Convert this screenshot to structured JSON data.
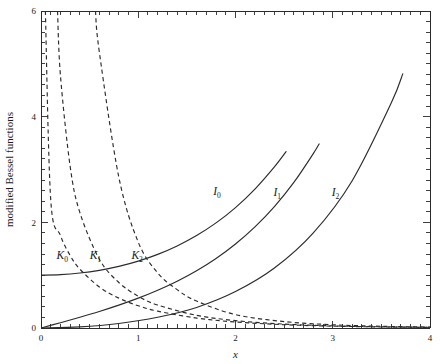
{
  "chart_data": {
    "type": "line",
    "title": "",
    "xlabel": "x",
    "ylabel": "modified Bessel functions",
    "xlim": [
      0,
      4
    ],
    "ylim": [
      0,
      6
    ],
    "xticks": [
      0,
      1,
      2,
      3,
      4
    ],
    "xtick_labels": [
      "0",
      "1",
      "2",
      "3",
      "4"
    ],
    "yticks": [
      0,
      2,
      4,
      6
    ],
    "ytick_labels": [
      "0",
      "2",
      "4",
      "6"
    ],
    "xminor_step": 0.1,
    "yminor_step": 0.2,
    "grid": false,
    "legend": "inline-labels",
    "series": [
      {
        "name": "I_0",
        "label": "I",
        "subscript": "0",
        "style": "solid",
        "color": "#2b2b2b",
        "label_x": 1.77,
        "label_y": 2.52,
        "x": [
          0,
          0.2,
          0.4,
          0.6,
          0.8,
          1.0,
          1.2,
          1.4,
          1.6,
          1.8,
          2.0,
          2.2,
          2.4,
          2.52
        ],
        "y": [
          1.0,
          1.01,
          1.0404,
          1.092,
          1.1665,
          1.2661,
          1.3937,
          1.5534,
          1.75,
          1.9896,
          2.2796,
          2.6291,
          3.0493,
          3.3387
        ]
      },
      {
        "name": "I_1",
        "label": "I",
        "subscript": "1",
        "style": "solid",
        "color": "#2b2b2b",
        "label_x": 2.39,
        "label_y": 2.5,
        "x": [
          0,
          0.2,
          0.4,
          0.6,
          0.8,
          1.0,
          1.2,
          1.4,
          1.6,
          1.8,
          2.0,
          2.2,
          2.4,
          2.6,
          2.8,
          2.86
        ],
        "y": [
          0.0,
          0.1005,
          0.204,
          0.3137,
          0.4329,
          0.5652,
          0.7147,
          0.8861,
          1.0848,
          1.3172,
          1.5906,
          1.9141,
          2.2981,
          2.7554,
          3.3011,
          3.4833
        ]
      },
      {
        "name": "I_2",
        "label": "I",
        "subscript": "2",
        "style": "solid",
        "color": "#2b2b2b",
        "label_x": 2.99,
        "label_y": 2.5,
        "x": [
          0,
          0.4,
          0.8,
          1.2,
          1.6,
          2.0,
          2.4,
          2.8,
          3.2,
          3.6,
          3.72
        ],
        "y": [
          0.0,
          0.0203,
          0.0843,
          0.2026,
          0.3885,
          0.6889,
          1.1342,
          1.7994,
          2.7883,
          4.2536,
          4.81
        ]
      },
      {
        "name": "K_0",
        "label": "K",
        "subscript": "0",
        "style": "dashed",
        "color": "#2b2b2b",
        "label_x": 0.16,
        "label_y": 1.3,
        "x": [
          0.045,
          0.1,
          0.2,
          0.3,
          0.4,
          0.6,
          0.8,
          1.0,
          1.2,
          1.6,
          2.0,
          2.5,
          3.0,
          3.5,
          4.0
        ],
        "y": [
          6.0,
          2.4271,
          1.7527,
          1.3725,
          1.1145,
          0.7775,
          0.5653,
          0.421,
          0.3185,
          0.188,
          0.1139,
          0.0623,
          0.0347,
          0.0196,
          0.0112
        ]
      },
      {
        "name": "K_1",
        "label": "K",
        "subscript": "1",
        "style": "dashed",
        "color": "#2b2b2b",
        "label_x": 0.5,
        "label_y": 1.3,
        "x": [
          0.17,
          0.2,
          0.3,
          0.4,
          0.6,
          0.8,
          1.0,
          1.2,
          1.6,
          2.0,
          2.5,
          3.0,
          3.5,
          4.0
        ],
        "y": [
          6.0,
          4.776,
          3.056,
          2.1843,
          1.3028,
          0.8618,
          0.6019,
          0.4346,
          0.2406,
          0.1399,
          0.0739,
          0.0402,
          0.0222,
          0.0125
        ]
      },
      {
        "name": "K_2",
        "label": "K",
        "subscript": "2",
        "style": "dashed",
        "color": "#2b2b2b",
        "label_x": 0.93,
        "label_y": 1.3,
        "x": [
          0.56,
          0.6,
          0.8,
          1.0,
          1.2,
          1.4,
          1.6,
          2.0,
          2.5,
          3.0,
          3.5,
          4.0
        ],
        "y": [
          6.0,
          5.2204,
          2.8575,
          1.6248,
          1.0428,
          0.7259,
          0.5098,
          0.2538,
          0.1214,
          0.0615,
          0.0324,
          0.0175
        ]
      }
    ],
    "annotations": [
      {
        "text": "I0",
        "x": 1.77,
        "y": 2.52
      },
      {
        "text": "I1",
        "x": 2.39,
        "y": 2.5
      },
      {
        "text": "I2",
        "x": 2.99,
        "y": 2.5
      },
      {
        "text": "K0",
        "x": 0.16,
        "y": 1.3
      },
      {
        "text": "K1",
        "x": 0.5,
        "y": 1.3
      },
      {
        "text": "K2",
        "x": 0.93,
        "y": 1.3
      }
    ]
  },
  "figure": {
    "background": "#ffffff",
    "axis_color": "#2b2b2b",
    "plot_left": 41,
    "plot_right": 430,
    "plot_top": 11,
    "plot_bottom": 328
  }
}
